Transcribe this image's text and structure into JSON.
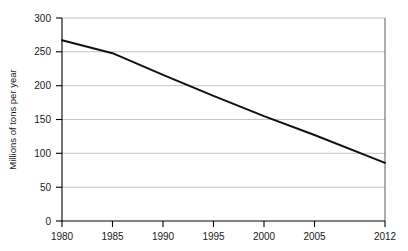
{
  "chart_data": {
    "type": "line",
    "title": "",
    "xlabel": "",
    "ylabel": "Millions of tons per year",
    "x": [
      1980,
      1985,
      1990,
      1995,
      2000,
      2005,
      2012
    ],
    "values": [
      267,
      248,
      216,
      185,
      155,
      127,
      86
    ],
    "series": [
      {
        "name": "",
        "values": [
          267,
          248,
          216,
          185,
          155,
          127,
          86
        ]
      }
    ],
    "categories": [
      "1980",
      "1985",
      "1990",
      "1995",
      "2000",
      "2005",
      "2012"
    ],
    "xtick_labels": [
      "1980",
      "1985",
      "1990",
      "1995",
      "2000",
      "2005",
      "2012"
    ],
    "ytick_labels": [
      "0",
      "50",
      "100",
      "150",
      "200",
      "250",
      "300"
    ],
    "ytick_values": [
      0,
      50,
      100,
      150,
      200,
      250,
      300
    ],
    "xlim": [
      1980,
      2012
    ],
    "ylim": [
      0,
      300
    ],
    "grid": "horizontal",
    "legend": "none",
    "line_color": "#111111",
    "grid_color": "#b4b4b4",
    "axis_color": "#000000",
    "background_color": "#ffffff"
  }
}
